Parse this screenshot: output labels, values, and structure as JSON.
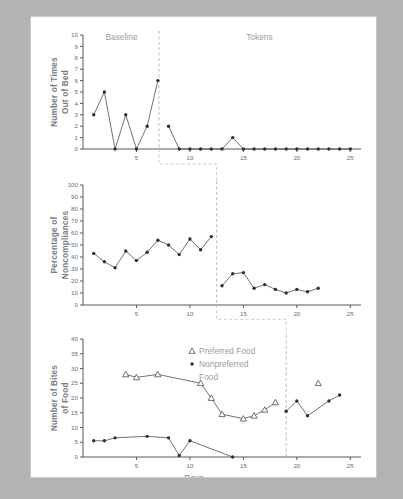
{
  "figure": {
    "xlabel": "Days",
    "phase_labels": {
      "baseline": "Baseline",
      "tokens": "Tokens"
    }
  },
  "legend": {
    "preferred": "Preferred Food",
    "nonpreferred_line1": "Nonpreferred",
    "nonpreferred_line2": "Food"
  },
  "chart_data": [
    {
      "type": "line",
      "title": "",
      "ylabel": "Number of Times Out of Bed",
      "xlabel": "",
      "ylim": [
        0,
        10
      ],
      "xlim": [
        0,
        26
      ],
      "ytick_labels": [
        "0",
        "1",
        "2",
        "3",
        "4",
        "5",
        "6",
        "7",
        "8",
        "9",
        "10"
      ],
      "xtick_labels": [
        "5",
        "10",
        "15",
        "20",
        "25"
      ],
      "xticks": [
        5,
        10,
        15,
        20,
        25
      ],
      "grid": false,
      "legend_position": "none",
      "phase_change_x": 7.1,
      "phases": [
        {
          "label": "Baseline",
          "x_center": 3.6
        },
        {
          "label": "Tokens",
          "x_center": 16.5
        }
      ],
      "series": [
        {
          "name": "Number of Times Out of Bed",
          "marker": "dot",
          "x": [
            1,
            2,
            3,
            4,
            5,
            6,
            7,
            8,
            9,
            10,
            11,
            12,
            13,
            14,
            15,
            16,
            17,
            18,
            19,
            20,
            21,
            22,
            23,
            24,
            25
          ],
          "values": [
            3,
            5,
            0,
            3,
            0,
            2,
            6,
            2,
            0,
            0,
            0,
            0,
            0,
            1,
            0,
            0,
            0,
            0,
            0,
            0,
            0,
            0,
            0,
            0,
            0
          ],
          "break_after_x": 7
        }
      ]
    },
    {
      "type": "line",
      "title": "",
      "ylabel": "Percentage of Noncompliances",
      "xlabel": "",
      "ylim": [
        0,
        100
      ],
      "xlim": [
        0,
        26
      ],
      "ytick_labels": [
        "0",
        "10",
        "20",
        "30",
        "40",
        "50",
        "60",
        "70",
        "80",
        "90",
        "100"
      ],
      "xtick_labels": [
        "5",
        "10",
        "15",
        "20",
        "25"
      ],
      "xticks": [
        5,
        10,
        15,
        20,
        25
      ],
      "grid": false,
      "legend_position": "none",
      "phase_change_x": 12.5,
      "series": [
        {
          "name": "Percentage of Noncompliances",
          "marker": "dot",
          "x": [
            1,
            2,
            3,
            4,
            5,
            6,
            7,
            8,
            9,
            10,
            11,
            12,
            13,
            14,
            15,
            16,
            17,
            18,
            19,
            20,
            21,
            22
          ],
          "values": [
            43,
            36,
            31,
            45,
            37,
            44,
            54,
            50,
            42,
            55,
            46,
            57,
            16,
            26,
            27,
            14,
            17,
            13,
            10,
            13,
            11,
            14
          ],
          "break_after_x": 12
        }
      ]
    },
    {
      "type": "line",
      "title": "",
      "ylabel": "Number of Bites of Food",
      "xlabel": "Days",
      "ylim": [
        0,
        40
      ],
      "xlim": [
        0,
        26
      ],
      "ytick_labels": [
        "0",
        "5",
        "10",
        "15",
        "20",
        "25",
        "30",
        "35",
        "40"
      ],
      "xtick_labels": [
        "5",
        "10",
        "15",
        "20",
        "25"
      ],
      "xticks": [
        5,
        10,
        15,
        20,
        25
      ],
      "grid": false,
      "legend_position": "upper-center",
      "phase_change_x": 19,
      "series": [
        {
          "name": "Preferred Food",
          "marker": "triangle",
          "x": [
            4,
            5,
            7,
            11,
            12,
            13,
            15,
            16,
            17,
            18
          ],
          "values": [
            28,
            27,
            28,
            25,
            20,
            14.5,
            13,
            14,
            16,
            18.5
          ],
          "extra_points": [
            {
              "x": 22,
              "y": 25
            }
          ]
        },
        {
          "name": "Nonpreferred Food",
          "marker": "dot",
          "x": [
            1,
            2,
            3,
            6,
            8,
            9,
            10,
            14,
            19,
            20,
            21,
            23,
            24
          ],
          "values": [
            5.5,
            5.5,
            6.5,
            7,
            6.5,
            0.5,
            5.5,
            0,
            15.5,
            19,
            14,
            19,
            21
          ],
          "break_after_x": 14
        }
      ]
    }
  ]
}
